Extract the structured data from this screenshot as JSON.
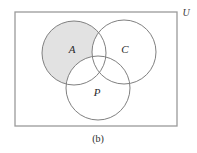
{
  "figure": {
    "caption": "(b)",
    "universe_label": "U",
    "shaded_description": "A minus (C union P)",
    "background_color": "#ffffff",
    "shade_color": "#e2e2e2",
    "stroke_color": "#808080",
    "rect_stroke_color": "#9a9a9a",
    "text_color": "#2b2b2b"
  },
  "rectangle": {
    "name": "universal-set",
    "x": 15,
    "y": 12,
    "width": 162,
    "height": 114
  },
  "circles": [
    {
      "id": "A",
      "label": "A",
      "cx": 74,
      "cy": 53,
      "r": 32,
      "label_x": 72,
      "label_y": 50,
      "shaded": true
    },
    {
      "id": "C",
      "label": "C",
      "cx": 124,
      "cy": 52,
      "r": 32,
      "label_x": 125,
      "label_y": 50,
      "shaded": false
    },
    {
      "id": "P",
      "label": "P",
      "cx": 98,
      "cy": 88,
      "r": 32,
      "label_x": 97,
      "label_y": 93,
      "shaded": false
    }
  ]
}
